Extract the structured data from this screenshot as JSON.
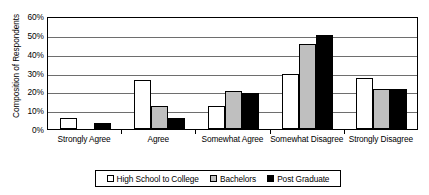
{
  "chart_data": {
    "type": "bar",
    "title": "",
    "xlabel": "",
    "ylabel": "Composition of Respondents",
    "categories": [
      "Strongly Agree",
      "Agree",
      "Somewhat Agree",
      "Somewhat Disagree",
      "Strongly Disagree"
    ],
    "series": [
      {
        "name": "High School to College",
        "color": "#ffffff",
        "values": [
          6,
          26,
          12,
          29,
          27
        ]
      },
      {
        "name": "Bachelors",
        "color": "#bfbfbf",
        "values": [
          0,
          12,
          20,
          45,
          21.5
        ]
      },
      {
        "name": "Post Graduate",
        "color": "#000000",
        "values": [
          3,
          6,
          19,
          50,
          21.5
        ]
      }
    ],
    "ylim": [
      0,
      60
    ],
    "ytick_values": [
      0,
      10,
      20,
      30,
      40,
      50,
      60
    ],
    "ytick_labels": [
      "0%",
      "10%",
      "20%",
      "30%",
      "40%",
      "50%",
      "60%"
    ],
    "grid": "horizontal",
    "legend_position": "bottom",
    "units": "percent"
  }
}
